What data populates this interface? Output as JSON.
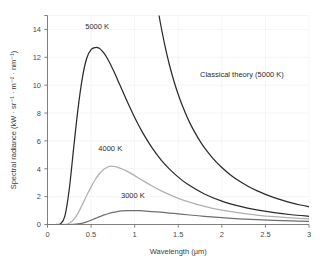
{
  "chart_data": {
    "type": "line",
    "title": "",
    "xlabel": "Wavelength (µm)",
    "ylabel": "Spectral radiance (kW · sr⁻¹ · m⁻² · nm⁻¹)",
    "xlim": [
      0,
      3
    ],
    "ylim": [
      0,
      15
    ],
    "xticks": [
      0,
      0.5,
      1,
      1.5,
      2,
      2.5,
      3
    ],
    "xtick_labels": [
      "0",
      "0.5",
      "1",
      "1.5",
      "2",
      "2.5",
      "3"
    ],
    "yticks": [
      0,
      2,
      4,
      6,
      8,
      10,
      12,
      14
    ],
    "ytick_labels": [
      "0",
      "2",
      "4",
      "6",
      "8",
      "10",
      "12",
      "14"
    ],
    "grid": true,
    "legend_position": "inline-annotations",
    "series": [
      {
        "name": "5000 K",
        "label": "5000 K",
        "color": "#2b2b2b",
        "width": 1.25,
        "label_x": 0.57,
        "label_y": 14.05,
        "peak": {
          "x": 0.58,
          "y": 12.7
        },
        "x": [
          0.0,
          0.05,
          0.1,
          0.15,
          0.2,
          0.25,
          0.3,
          0.35,
          0.4,
          0.45,
          0.5,
          0.55,
          0.58,
          0.6,
          0.65,
          0.7,
          0.75,
          0.8,
          0.9,
          1.0,
          1.1,
          1.2,
          1.3,
          1.4,
          1.5,
          1.6,
          1.8,
          2.0,
          2.2,
          2.4,
          2.6,
          2.8,
          3.0
        ],
        "y": [
          0.0,
          0.0,
          0.0,
          0.05,
          0.62,
          2.55,
          5.48,
          8.3,
          10.52,
          11.93,
          12.55,
          12.7,
          12.68,
          12.62,
          12.28,
          11.77,
          11.14,
          10.45,
          9.03,
          7.68,
          6.5,
          5.5,
          4.66,
          3.97,
          3.4,
          2.92,
          2.19,
          1.68,
          1.32,
          1.05,
          0.85,
          0.7,
          0.59
        ]
      },
      {
        "name": "4000 K",
        "label": "4000 K",
        "color": "#b0b0b0",
        "width": 1.25,
        "label_x": 0.72,
        "label_y": 5.3,
        "peak": {
          "x": 0.72,
          "y": 4.18
        },
        "x": [
          0.0,
          0.1,
          0.2,
          0.25,
          0.3,
          0.35,
          0.4,
          0.45,
          0.5,
          0.55,
          0.6,
          0.65,
          0.7,
          0.72,
          0.75,
          0.8,
          0.9,
          1.0,
          1.1,
          1.2,
          1.3,
          1.4,
          1.5,
          1.6,
          1.8,
          2.0,
          2.2,
          2.4,
          2.6,
          2.8,
          3.0
        ],
        "y": [
          0.0,
          0.0,
          0.01,
          0.09,
          0.35,
          0.82,
          1.43,
          2.08,
          2.7,
          3.25,
          3.68,
          3.98,
          4.15,
          4.18,
          4.17,
          4.12,
          3.87,
          3.51,
          3.13,
          2.76,
          2.43,
          2.14,
          1.88,
          1.66,
          1.3,
          1.03,
          0.83,
          0.68,
          0.56,
          0.47,
          0.4
        ]
      },
      {
        "name": "3000 K",
        "label": "3000 K",
        "color": "#6e6e6e",
        "width": 1.25,
        "label_x": 0.98,
        "label_y": 1.9,
        "peak": {
          "x": 0.97,
          "y": 1.0
        },
        "x": [
          0.0,
          0.15,
          0.25,
          0.3,
          0.35,
          0.4,
          0.45,
          0.5,
          0.55,
          0.6,
          0.65,
          0.7,
          0.75,
          0.8,
          0.85,
          0.9,
          0.95,
          1.0,
          1.05,
          1.1,
          1.2,
          1.3,
          1.4,
          1.5,
          1.6,
          1.8,
          2.0,
          2.2,
          2.4,
          2.6,
          2.8,
          3.0
        ],
        "y": [
          0.0,
          0.0,
          0.0,
          0.01,
          0.04,
          0.1,
          0.19,
          0.31,
          0.44,
          0.57,
          0.69,
          0.79,
          0.87,
          0.93,
          0.97,
          0.99,
          1.0,
          1.0,
          0.99,
          0.98,
          0.93,
          0.88,
          0.82,
          0.76,
          0.7,
          0.59,
          0.49,
          0.41,
          0.35,
          0.3,
          0.26,
          0.22
        ]
      },
      {
        "name": "Classical theory (5000 K)",
        "label": "Classical theory (5000 K)",
        "color": "#2b2b2b",
        "width": 1.25,
        "label_x": 1.75,
        "label_y": 10.6,
        "note": "Rayleigh-Jeans law, diverges as wavelength decreases",
        "x": [
          1.28,
          1.3,
          1.35,
          1.4,
          1.45,
          1.5,
          1.55,
          1.6,
          1.65,
          1.7,
          1.75,
          1.8,
          1.9,
          2.0,
          2.1,
          2.2,
          2.3,
          2.4,
          2.5,
          2.6,
          2.7,
          2.8,
          2.9,
          3.0
        ],
        "y": [
          15.0,
          14.3,
          12.75,
          11.43,
          10.3,
          9.33,
          8.48,
          7.74,
          7.08,
          6.5,
          5.98,
          5.52,
          4.73,
          4.09,
          3.56,
          3.12,
          2.75,
          2.43,
          2.16,
          1.93,
          1.73,
          1.55,
          1.4,
          1.27
        ]
      }
    ]
  },
  "figure": {
    "background_color": "#ffffff",
    "axis_color": "#737373",
    "grid_color": "#f2f2f2",
    "text_color": "#3c3c3c"
  }
}
